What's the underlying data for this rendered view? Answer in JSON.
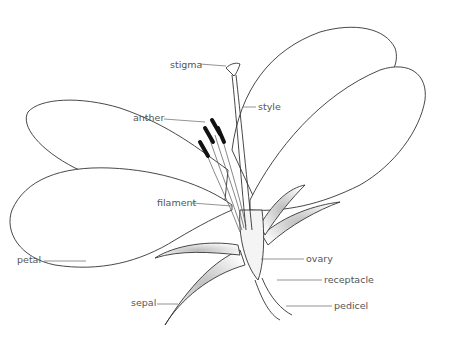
{
  "diagram": {
    "labels": [
      {
        "id": "stigma",
        "text": "stigma"
      },
      {
        "id": "style",
        "text": "style"
      },
      {
        "id": "anther",
        "text": "anther"
      },
      {
        "id": "filament",
        "text": "filament"
      },
      {
        "id": "petal",
        "text": "petal"
      },
      {
        "id": "ovary",
        "text": "ovary"
      },
      {
        "id": "receptacle",
        "text": "receptacle"
      },
      {
        "id": "sepal",
        "text": "sepal"
      },
      {
        "id": "pedicel",
        "text": "pedicel"
      }
    ]
  }
}
